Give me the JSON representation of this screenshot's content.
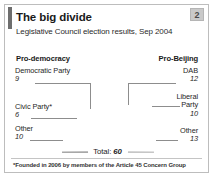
{
  "card": {
    "badge": "2",
    "title": "The big divide",
    "subtitle": "Legislative Council election results, Sep 2004",
    "footnote": "*Founded in 2006 by members of the Article 45 Concern Group",
    "total_label": "Total:",
    "total_value": "60"
  },
  "columns": {
    "left_header": "Pro-democracy",
    "right_header": "Pro-Beijing"
  },
  "labels": {
    "democratic_party": {
      "name": "Democratic Party",
      "value": "9"
    },
    "civic_party": {
      "name": "Civic Party*",
      "value": "6"
    },
    "other_left": {
      "name": "Other",
      "value": "10"
    },
    "dab": {
      "name": "DAB",
      "value": "12"
    },
    "liberal_party": {
      "name": "Liberal",
      "name2": "Party",
      "value": "10"
    },
    "other_right": {
      "name": "Other",
      "value": "13"
    }
  },
  "colors": {
    "accent_bar": "#6e6e6e",
    "badge_bg": "#c9c9c9",
    "border": "#bdbdbd",
    "leader_line": "#8d8d8d",
    "other_left": "#a8a8a8",
    "civic_party": "#4a4a4a",
    "democratic_party": "#bdbdbd",
    "dab": "#b0b0b0",
    "liberal_party": "#9a9a9a",
    "other_right": "#c6c6c6"
  },
  "chart_data": {
    "type": "pie",
    "title": "The big divide",
    "subtitle": "Legislative Council election results, Sep 2004",
    "shape": "half-donut",
    "total": 60,
    "unit": "seats",
    "categories": [
      "Other",
      "Civic Party*",
      "Democratic Party",
      "DAB",
      "Liberal Party",
      "Other"
    ],
    "values": [
      10,
      6,
      9,
      12,
      10,
      13
    ],
    "groups": [
      "Pro-democracy",
      "Pro-democracy",
      "Pro-democracy",
      "Pro-Beijing",
      "Pro-Beijing",
      "Pro-Beijing"
    ],
    "group_totals": {
      "Pro-democracy": 25,
      "Pro-Beijing": 35
    },
    "slice_colors": [
      "#a8a8a8",
      "#4a4a4a",
      "#bdbdbd",
      "#b0b0b0",
      "#9a9a9a",
      "#c6c6c6"
    ],
    "legend": "leader-lines",
    "grid": false
  }
}
